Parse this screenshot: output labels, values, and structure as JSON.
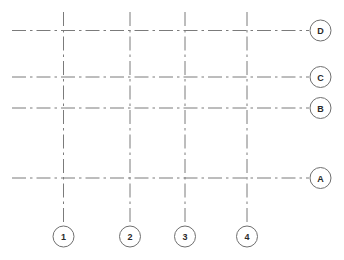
{
  "drawing": {
    "title": "Structural column grid plan",
    "canvas": {
      "width": 344,
      "height": 260,
      "background": "#ffffff"
    },
    "style": {
      "grid_line_color": "#7b7b7b",
      "grid_line_width": 1,
      "grid_line_pattern": "dash-dot",
      "bubble_stroke_color": "#6f6f6f",
      "bubble_fill": "#ffffff",
      "bubble_radius": 10.5,
      "label_color": "#2a2a2a",
      "footer_color": "#dcdcdc"
    },
    "extents": {
      "horizontal_line_start_x": 12,
      "horizontal_line_end_x": 309,
      "vertical_line_start_y": 12,
      "vertical_line_end_y": 226
    },
    "horizontal_gridlines": [
      {
        "label": "D",
        "y": 30.5,
        "bubble_cx": 320.5,
        "bubble_cy": 30.5
      },
      {
        "label": "C",
        "y": 77.0,
        "bubble_cx": 320.5,
        "bubble_cy": 77.0
      },
      {
        "label": "B",
        "y": 108.0,
        "bubble_cx": 320.5,
        "bubble_cy": 108.0
      },
      {
        "label": "A",
        "y": 178.0,
        "bubble_cx": 320.5,
        "bubble_cy": 178.0
      }
    ],
    "vertical_gridlines": [
      {
        "label": "1",
        "x": 63.5,
        "bubble_cx": 63.5,
        "bubble_cy": 236.5
      },
      {
        "label": "2",
        "x": 130.0,
        "bubble_cx": 130.0,
        "bubble_cy": 236.5
      },
      {
        "label": "3",
        "x": 185.0,
        "bubble_cx": 185.0,
        "bubble_cy": 236.5
      },
      {
        "label": "4",
        "x": 247.0,
        "bubble_cx": 247.0,
        "bubble_cy": 236.5
      }
    ],
    "footer": {
      "text": "",
      "x": 180,
      "y": 256
    }
  }
}
